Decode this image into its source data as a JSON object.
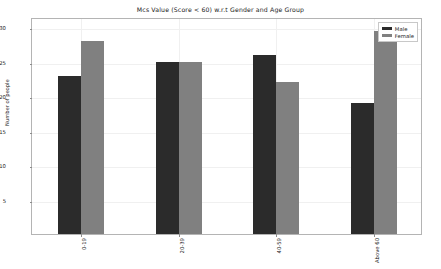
{
  "chart_data": {
    "type": "bar",
    "title": "Mcs Value (Score < 60) w.r.t Gender and Age Group",
    "xlabel": "",
    "ylabel": "Number of people",
    "categories": [
      "0-19",
      "20-39",
      "40-59",
      "Above 60"
    ],
    "series": [
      {
        "name": "Male",
        "color": "#2b2b2b",
        "values": [
          23,
          25,
          26,
          19
        ]
      },
      {
        "name": "Female",
        "color": "#808080",
        "values": [
          28,
          25,
          22,
          29.5
        ]
      }
    ],
    "ylim": [
      0,
      31.5
    ],
    "yticks": [
      5,
      10,
      15,
      20,
      25,
      30
    ],
    "ytick_labels": [
      "5",
      "10",
      "15",
      "20",
      "25",
      "30"
    ],
    "grid": true,
    "legend_position": "upper right",
    "legend_entries": [
      "Male",
      "Female"
    ],
    "background": "#ffffff",
    "axes_edge_color": "#b4b4b4",
    "grid_color": "#f0f0f0"
  }
}
